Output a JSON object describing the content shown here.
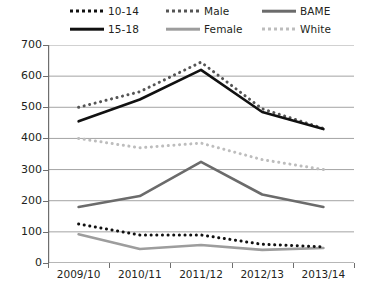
{
  "chart_data": {
    "type": "line",
    "title": "",
    "xlabel": "",
    "ylabel": "",
    "categories": [
      "2009/10",
      "2010/11",
      "2011/12",
      "2012/13",
      "2013/14"
    ],
    "ylim": [
      0,
      700
    ],
    "ytick_values": [
      0,
      100,
      200,
      300,
      400,
      500,
      600,
      700
    ],
    "ytick_labels": [
      "0",
      "100",
      "200",
      "300",
      "400",
      "500",
      "600",
      "700"
    ],
    "grid": true,
    "legend_position": "top",
    "series": [
      {
        "name": "10-14",
        "values": [
          125,
          90,
          90,
          60,
          52
        ],
        "color": "#111111",
        "style": "dotted",
        "width": 3.0
      },
      {
        "name": "15-18",
        "values": [
          455,
          525,
          620,
          485,
          430
        ],
        "color": "#111111",
        "style": "solid",
        "width": 2.6
      },
      {
        "name": "Male",
        "values": [
          500,
          550,
          645,
          495,
          432
        ],
        "color": "#555555",
        "style": "dotted",
        "width": 3.0
      },
      {
        "name": "Female",
        "values": [
          92,
          45,
          58,
          42,
          48
        ],
        "color": "#9d9d9d",
        "style": "solid",
        "width": 2.6
      },
      {
        "name": "BAME",
        "values": [
          180,
          215,
          325,
          220,
          180
        ],
        "color": "#6b6b6b",
        "style": "solid",
        "width": 2.6
      },
      {
        "name": "White",
        "values": [
          400,
          370,
          385,
          332,
          300
        ],
        "color": "#bdbdbd",
        "style": "dotted",
        "width": 3.0
      }
    ]
  },
  "legend": {
    "items": [
      {
        "label": "10-14",
        "series": "10-14"
      },
      {
        "label": "15-18",
        "series": "15-18"
      },
      {
        "label": "Male",
        "series": "Male"
      },
      {
        "label": "Female",
        "series": "Female"
      },
      {
        "label": "BAME",
        "series": "BAME"
      },
      {
        "label": "White",
        "series": "White"
      }
    ]
  },
  "axes": {
    "y_labels": [
      "700",
      "600",
      "500",
      "400",
      "300",
      "200",
      "100",
      "0"
    ],
    "x_labels": [
      "2009/10",
      "2010/11",
      "2011/12",
      "2012/13",
      "2013/14"
    ]
  },
  "colors": {
    "axis": "#6e6e6e",
    "grid": "#9a9a9a",
    "text": "#231f20",
    "background": "#ffffff"
  }
}
